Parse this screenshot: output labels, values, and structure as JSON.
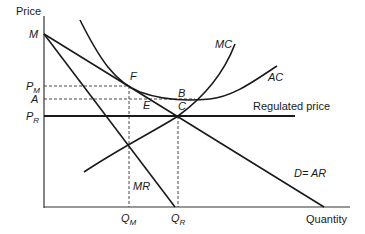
{
  "diagram": {
    "axes": {
      "y_label": "Price",
      "x_label": "Quantity"
    },
    "y_ticks": [
      {
        "main": "M",
        "sub": ""
      },
      {
        "main": "P",
        "sub": "M"
      },
      {
        "main": "A",
        "sub": ""
      },
      {
        "main": "P",
        "sub": "R"
      }
    ],
    "x_ticks": [
      {
        "main": "Q",
        "sub": "M"
      },
      {
        "main": "Q",
        "sub": "R"
      }
    ],
    "curves": {
      "mc": "MC",
      "ac": "AC",
      "mr": "MR",
      "demand": "D= AR",
      "regulated": "Regulated price"
    },
    "points": {
      "F": "F",
      "B": "B",
      "E": "E",
      "C": "C"
    },
    "colors": {
      "line": "#1a1a1a",
      "background": "#ffffff"
    }
  }
}
